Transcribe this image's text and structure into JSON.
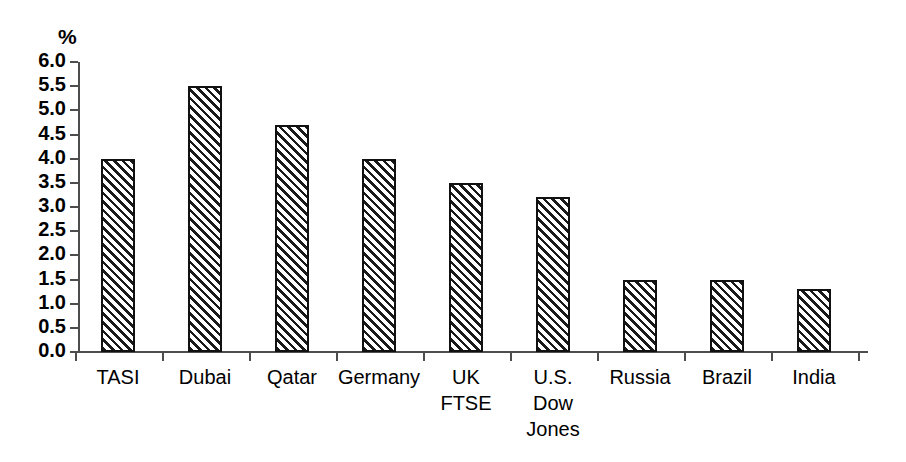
{
  "chart_data": {
    "type": "bar",
    "title": "",
    "subtitle": "",
    "xlabel": "",
    "ylabel": "%",
    "unit_label": "%",
    "ylim": [
      0.0,
      6.0
    ],
    "ytick_step": 0.5,
    "grid": false,
    "legend": false,
    "legend_position": "none",
    "orientation": "vertical",
    "bar_style": "diagonal-hatch",
    "categories": [
      "TASI",
      "Dubai",
      "Qatar",
      "Germany",
      "UK\nFTSE",
      "U.S.\nDow\nJones",
      "Russia",
      "Brazil",
      "India"
    ],
    "values": [
      4.0,
      5.5,
      4.7,
      4.0,
      3.5,
      3.2,
      1.5,
      1.5,
      1.3
    ],
    "ytick_labels": [
      "0.0",
      "0.5",
      "1.0",
      "1.5",
      "2.0",
      "2.5",
      "3.0",
      "3.5",
      "4.0",
      "4.5",
      "5.0",
      "5.5",
      "6.0"
    ],
    "ytick_values": [
      0.0,
      0.5,
      1.0,
      1.5,
      2.0,
      2.5,
      3.0,
      3.5,
      4.0,
      4.5,
      5.0,
      5.5,
      6.0
    ],
    "colors": {
      "bar_fill": "#ffffff",
      "bar_hatch": "#1a1a1a",
      "bar_border": "#111111",
      "axis": "#4d4d4d",
      "text": "#000000",
      "background": "#ffffff"
    }
  }
}
